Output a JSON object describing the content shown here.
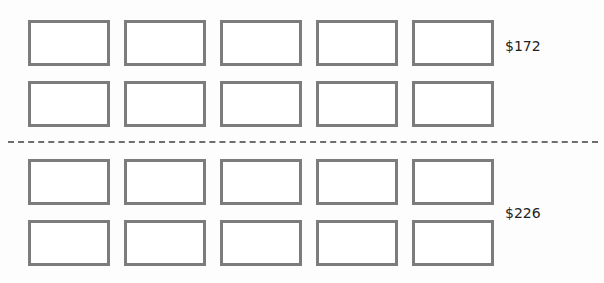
{
  "groups": [
    {
      "label": "$172",
      "rows": 2,
      "columns": 5
    },
    {
      "label": "$226",
      "rows": 2,
      "columns": 5
    }
  ],
  "colors": {
    "box_border": "#7c7c7c",
    "divider": "#6e6e6e",
    "text": "#222222"
  }
}
